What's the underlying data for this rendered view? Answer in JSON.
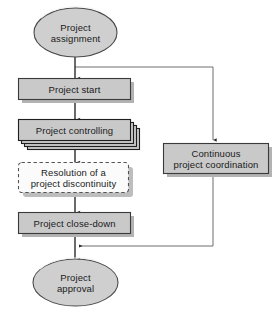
{
  "diagram": {
    "colors": {
      "fill_gray": "#c9c9c9",
      "fill_gray_light": "#d2d2d2",
      "shadow_gray": "#b3b3b3",
      "stroke_dark": "#2b2b2b",
      "stroke_mid": "#6e6e6e",
      "connector": "#555555",
      "dashed_fill": "#fbfbfb",
      "text": "#1a1a1a",
      "background": "#ffffff"
    },
    "nodes": [
      {
        "id": "project-assignment",
        "shape": "ellipse",
        "lines": [
          "Project",
          "assignment"
        ],
        "style": "filled"
      },
      {
        "id": "project-start",
        "shape": "rectangle",
        "lines": [
          "Project start"
        ],
        "style": "filled-shadow"
      },
      {
        "id": "project-controlling",
        "shape": "rectangle-stack",
        "lines": [
          "Project controlling"
        ],
        "style": "filled-stacked"
      },
      {
        "id": "resolution-of-a-project-discontinuity",
        "shape": "rectangle-dashed",
        "lines": [
          "Resolution of a",
          "project discontinuity"
        ],
        "style": "dashed-shadow"
      },
      {
        "id": "project-close-down",
        "shape": "rectangle",
        "lines": [
          "Project close-down"
        ],
        "style": "filled-shadow"
      },
      {
        "id": "project-approval",
        "shape": "ellipse",
        "lines": [
          "Project",
          "approval"
        ],
        "style": "filled"
      },
      {
        "id": "continuous-project-coordination",
        "shape": "rectangle",
        "lines": [
          "Continuous",
          "project coordination"
        ],
        "style": "filled-shadow"
      }
    ],
    "edges": [
      {
        "id": "assignment-to-start",
        "from": "project-assignment",
        "to": "project-start",
        "kind": "arrow-down"
      },
      {
        "id": "start-to-controlling",
        "from": "project-start",
        "to": "project-controlling",
        "kind": "arrow-down"
      },
      {
        "id": "controlling-to-resolution",
        "from": "project-controlling",
        "to": "resolution-of-a-project-discontinuity",
        "kind": "arrow-down"
      },
      {
        "id": "resolution-to-close-down",
        "from": "resolution-of-a-project-discontinuity",
        "to": "project-close-down",
        "kind": "arrow-down"
      },
      {
        "id": "close-down-to-approval",
        "from": "project-close-down",
        "to": "project-approval",
        "kind": "arrow-down"
      },
      {
        "id": "branch-to-coordination",
        "from": "assignment-to-start",
        "to": "continuous-project-coordination",
        "kind": "branch-right-down-arrow"
      },
      {
        "id": "coordination-return",
        "from": "continuous-project-coordination",
        "to": "close-down-to-approval",
        "kind": "down-left-arrow"
      }
    ]
  }
}
